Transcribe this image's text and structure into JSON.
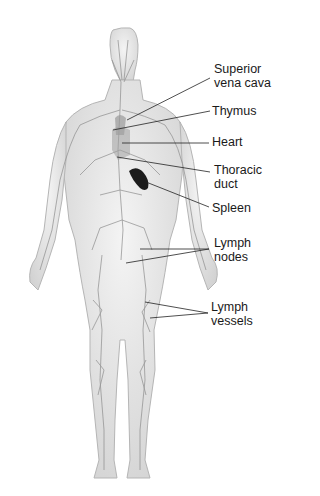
{
  "diagram": {
    "labels": [
      {
        "id": "superior-vena-cava",
        "line1": "Superior",
        "line2": "vena cava",
        "x": 214,
        "y": 62
      },
      {
        "id": "thymus",
        "line1": "Thymus",
        "line2": "",
        "x": 212,
        "y": 104
      },
      {
        "id": "heart",
        "line1": "Heart",
        "line2": "",
        "x": 212,
        "y": 135
      },
      {
        "id": "thoracic-duct",
        "line1": "Thoracic",
        "line2": "duct",
        "x": 214,
        "y": 163
      },
      {
        "id": "spleen",
        "line1": "Spleen",
        "line2": "",
        "x": 212,
        "y": 201
      },
      {
        "id": "lymph-nodes",
        "line1": "Lymph",
        "line2": "nodes",
        "x": 214,
        "y": 236
      },
      {
        "id": "lymph-vessels",
        "line1": "Lymph",
        "line2": "vessels",
        "x": 211,
        "y": 300
      }
    ],
    "colors": {
      "body": "#e6e6e6",
      "outline": "#b5b5b5",
      "vessel": "#8a8a8a",
      "spleen": "#1c1c1c",
      "leader": "#222222"
    }
  }
}
